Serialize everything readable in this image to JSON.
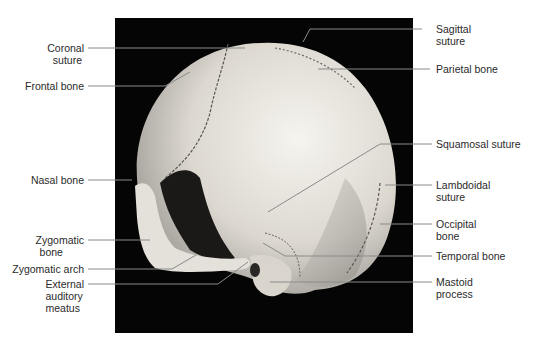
{
  "figure": {
    "background": "#050505",
    "bone_color": "#e6e3dc"
  },
  "labels": {
    "left": [
      {
        "id": "coronal-suture",
        "lines": [
          "Coronal",
          "suture"
        ]
      },
      {
        "id": "frontal-bone",
        "lines": [
          "Frontal bone"
        ]
      },
      {
        "id": "nasal-bone",
        "lines": [
          "Nasal bone"
        ]
      },
      {
        "id": "zygomatic-bone",
        "lines": [
          "Zygomatic",
          "bone"
        ]
      },
      {
        "id": "zygomatic-arch",
        "lines": [
          "Zygomatic arch"
        ]
      },
      {
        "id": "external-auditory-meatus",
        "lines": [
          "External",
          "auditory",
          "meatus"
        ]
      }
    ],
    "right": [
      {
        "id": "sagittal-suture",
        "lines": [
          "Sagittal",
          "suture"
        ]
      },
      {
        "id": "parietal-bone",
        "lines": [
          "Parietal bone"
        ]
      },
      {
        "id": "squamosal-suture",
        "lines": [
          "Squamosal suture"
        ]
      },
      {
        "id": "lambdoidal-suture",
        "lines": [
          "Lambdoidal",
          "suture"
        ]
      },
      {
        "id": "occipital-bone",
        "lines": [
          "Occipital",
          "bone"
        ]
      },
      {
        "id": "temporal-bone",
        "lines": [
          "Temporal bone"
        ]
      },
      {
        "id": "mastoid-process",
        "lines": [
          "Mastoid",
          "process"
        ]
      }
    ]
  }
}
